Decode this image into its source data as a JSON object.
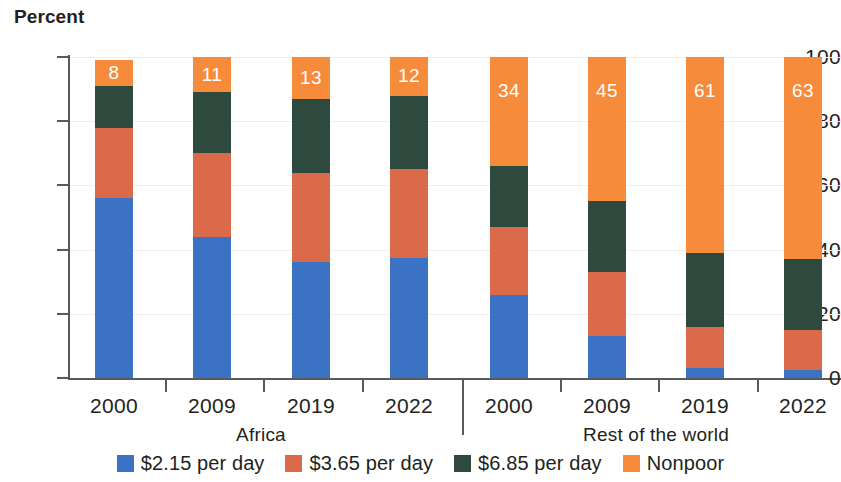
{
  "chart_data": {
    "type": "bar",
    "subtype": "stacked-bar-100",
    "title": "Percent",
    "xlabel": "",
    "ylabel": "Percent",
    "ylim": [
      0,
      100
    ],
    "yticks": [
      0,
      20,
      40,
      60,
      80,
      100
    ],
    "grid": false,
    "legend_position": "bottom",
    "categories": [
      "2000",
      "2009",
      "2019",
      "2022",
      "2000",
      "2009",
      "2019",
      "2022"
    ],
    "groups": [
      {
        "label": "Africa",
        "categories": [
          "2000",
          "2009",
          "2019",
          "2022"
        ]
      },
      {
        "label": "Rest of the world",
        "categories": [
          "2000",
          "2009",
          "2019",
          "2022"
        ]
      }
    ],
    "series": [
      {
        "name": "$2.15 per day",
        "color": "#3b72c4",
        "values": [
          56,
          44,
          36,
          37.5,
          26,
          13,
          3,
          2.5
        ]
      },
      {
        "name": "$3.65 per day",
        "color": "#db6a4a",
        "values": [
          22,
          26,
          28,
          27.5,
          21,
          20,
          13,
          12.5
        ]
      },
      {
        "name": "$6.85 per day",
        "color": "#2e4a3e",
        "values": [
          13,
          19,
          23,
          23,
          19,
          22,
          23,
          22
        ]
      },
      {
        "name": "Nonpoor",
        "color": "#f68b3c",
        "values": [
          8,
          11,
          13,
          12,
          34,
          45,
          61,
          63
        ]
      }
    ],
    "data_labels": {
      "series": "Nonpoor",
      "values": [
        "8",
        "11",
        "13",
        "12",
        "34",
        "45",
        "61",
        "63"
      ]
    }
  },
  "legend": {
    "items": [
      {
        "label": "$2.15 per day",
        "color": "#3b72c4"
      },
      {
        "label": "$3.65 per day",
        "color": "#db6a4a"
      },
      {
        "label": "$6.85 per day",
        "color": "#2e4a3e"
      },
      {
        "label": "Nonpoor",
        "color": "#f68b3c"
      }
    ]
  }
}
